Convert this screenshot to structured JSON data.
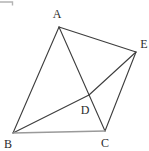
{
  "figure": {
    "background_color": "#ffffff",
    "line_color": "#3d3d3d",
    "base_line_color": "#9a9a9a",
    "label_color": "#2b2b2b",
    "artifact_color": "#b3b3b3",
    "artifact_path": "M0,2 L12.5,2 L12.5,5.5",
    "points": {
      "A": {
        "label": "A",
        "x": 59,
        "y": 27,
        "label_x": 57,
        "label_y": 18
      },
      "B": {
        "label": "B",
        "x": 13,
        "y": 133,
        "label_x": 8,
        "label_y": 148
      },
      "C": {
        "label": "C",
        "x": 105,
        "y": 131,
        "label_x": 105,
        "label_y": 147
      },
      "D": {
        "label": "D",
        "x": 89,
        "y": 95,
        "label_x": 85,
        "label_y": 114
      },
      "E": {
        "label": "E",
        "x": 136,
        "y": 52,
        "label_x": 144,
        "label_y": 48
      }
    },
    "edges": [
      {
        "from": "A",
        "to": "B",
        "color": "#3d3d3d",
        "width": 1.1
      },
      {
        "from": "A",
        "to": "E",
        "color": "#3d3d3d",
        "width": 1.1
      },
      {
        "from": "A",
        "to": "C",
        "color": "#3d3d3d",
        "width": 1.1
      },
      {
        "from": "E",
        "to": "C",
        "color": "#3d3d3d",
        "width": 1.1
      },
      {
        "from": "B",
        "to": "D",
        "color": "#3d3d3d",
        "width": 1.1
      },
      {
        "from": "D",
        "to": "E",
        "color": "#3d3d3d",
        "width": 1.1
      },
      {
        "from": "B",
        "to": "C",
        "color": "#9a9a9a",
        "width": 1.6
      }
    ]
  }
}
